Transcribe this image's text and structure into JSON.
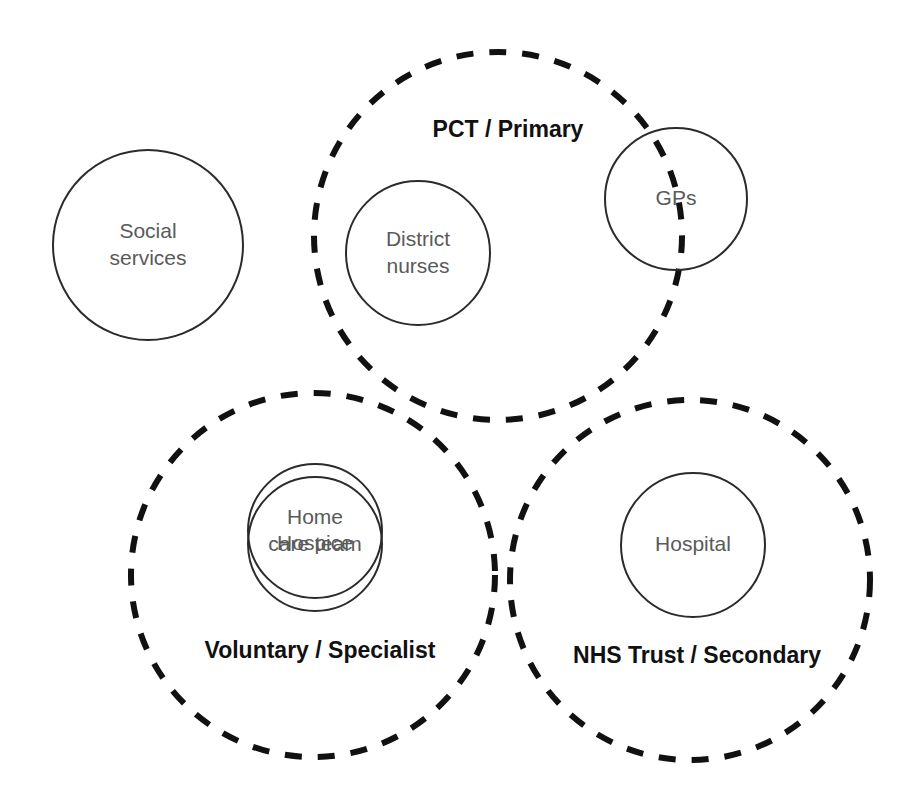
{
  "diagram": {
    "background_color": "#ffffff",
    "solid_stroke_color": "#2b2b2b",
    "dashed_stroke_color": "#111111",
    "node_text_color": "#5a5a5a",
    "group_text_color": "#111111",
    "groups": [
      {
        "id": "pct-primary",
        "label": "PCT / Primary",
        "style": "dashed",
        "cx": 498,
        "cy": 236,
        "r": 184,
        "label_x": 508,
        "label_y": 131
      },
      {
        "id": "voluntary-specialist",
        "label": "Voluntary / Specialist",
        "style": "dashed",
        "cx": 313,
        "cy": 575,
        "r": 182,
        "label_x": 320,
        "label_y": 652
      },
      {
        "id": "nhs-trust-secondary",
        "label": "NHS Trust / Secondary",
        "style": "dashed",
        "cx": 690,
        "cy": 580,
        "r": 180,
        "label_x": 697,
        "label_y": 657
      }
    ],
    "nodes": [
      {
        "id": "social-services",
        "label_lines": [
          "Social",
          "services"
        ],
        "style": "solid",
        "cx": 148,
        "cy": 245,
        "r": 95
      },
      {
        "id": "district-nurses",
        "label_lines": [
          "District",
          "nurses"
        ],
        "style": "solid",
        "cx": 418,
        "cy": 253,
        "r": 72
      },
      {
        "id": "gps",
        "label_lines": [
          "GPs"
        ],
        "style": "solid",
        "cx": 676,
        "cy": 199,
        "r": 71
      },
      {
        "id": "home-care-team",
        "label_lines": [
          "Home",
          "care team"
        ],
        "style": "solid",
        "cx": 315,
        "cy": 531,
        "r": 67
      },
      {
        "id": "hospice",
        "label_lines": [
          "Hospice"
        ],
        "style": "solid",
        "cx": 315,
        "cy": 544,
        "r": 67
      },
      {
        "id": "hospital",
        "label_lines": [
          "Hospital"
        ],
        "style": "solid",
        "cx": 693,
        "cy": 545,
        "r": 72
      }
    ]
  }
}
